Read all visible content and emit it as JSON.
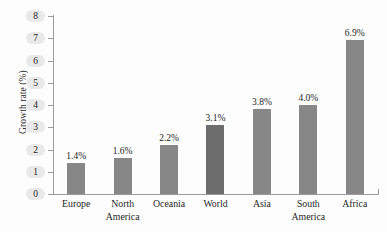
{
  "chart_data": {
    "type": "bar",
    "title": "",
    "xlabel": "",
    "ylabel": "Growth rate (%)",
    "ylim": [
      0,
      8
    ],
    "ytick_labels": [
      "0",
      "1",
      "2",
      "3",
      "4",
      "5",
      "6",
      "7",
      "8"
    ],
    "grid": false,
    "legend": "none",
    "categories": [
      "Europe",
      "North America",
      "Oceania",
      "World",
      "Asia",
      "South America",
      "Africa"
    ],
    "category_lines": [
      [
        "Europe"
      ],
      [
        "North",
        "America"
      ],
      [
        "Oceania"
      ],
      [
        "World"
      ],
      [
        "Asia"
      ],
      [
        "South",
        "America"
      ],
      [
        "Africa"
      ]
    ],
    "values": [
      1.4,
      1.6,
      2.2,
      3.1,
      3.8,
      4.0,
      6.9
    ],
    "value_labels": [
      "1.4%",
      "1.6%",
      "2.2%",
      "3.1%",
      "3.8%",
      "4.0%",
      "6.9%"
    ],
    "highlighted_category": "World",
    "colors": {
      "bar": "#878787",
      "bar_highlight": "#6d6d6d",
      "axis": "#9a9a9a",
      "text": "#1d1d1d",
      "tick_label_pill": "#e9e9e9",
      "background": "#fdfdfd"
    }
  }
}
